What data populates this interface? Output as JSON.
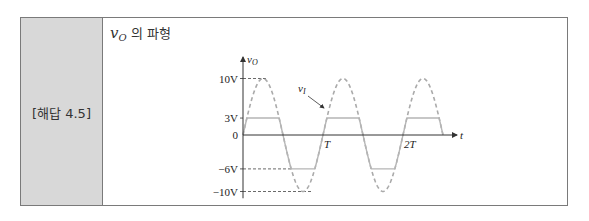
{
  "label": "[해답 4.5]",
  "title": {
    "symbol": "v",
    "subscript": "O",
    "text": "의 파형"
  },
  "chart_data": {
    "type": "line",
    "xlabel": "t",
    "ylabel": "v_O",
    "x_ticks": [
      {
        "label": "T",
        "value": 1
      },
      {
        "label": "2T",
        "value": 2
      }
    ],
    "y_ticks": [
      {
        "label": "10V",
        "value": 10
      },
      {
        "label": "3V",
        "value": 3
      },
      {
        "label": "0",
        "value": 0
      },
      {
        "label": "−6V",
        "value": -6
      },
      {
        "label": "−10V",
        "value": -10
      }
    ],
    "xlim": [
      0,
      2.65
    ],
    "ylim": [
      -10,
      10
    ],
    "series": [
      {
        "name": "v_I",
        "style": "dashed",
        "description": "input sine, amplitude 10V, period T",
        "amplitude": 10,
        "periods": 2.5
      },
      {
        "name": "v_O",
        "style": "solid",
        "description": "clipped output, upper clip 3V, lower clip -6V",
        "clip_high": 3,
        "clip_low": -6
      }
    ],
    "annotations": [
      {
        "text": "v_I",
        "points_to": "dashed input waveform"
      }
    ]
  },
  "labels": {
    "vo_axis": "v",
    "vo_sub": "O",
    "vi": "v",
    "vi_sub": "I",
    "t_axis": "t"
  }
}
